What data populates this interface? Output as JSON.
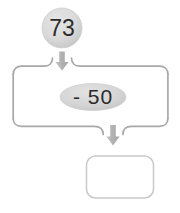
{
  "diagram": {
    "type": "function-machine-flow",
    "title": "",
    "start_node": {
      "label": "73",
      "shape": "circle",
      "fill_color": "#d9d9d9",
      "text_color": "#2b2b2b"
    },
    "operation_node": {
      "label": "- 50",
      "operator": "-",
      "operand": "50",
      "shape": "ellipse",
      "fill_color": "#d5d5d5",
      "text_color": "#2b2b2b"
    },
    "answer_node": {
      "label": "",
      "shape": "rounded-rectangle",
      "fill_color": "#ffffff",
      "border_color": "#c9c9c9"
    },
    "arrows": [
      {
        "name": "arrow-from-start",
        "direction": "down",
        "color": "#b5b5b5"
      },
      {
        "name": "arrow-to-answer",
        "direction": "down",
        "color": "#b5b5b5"
      }
    ],
    "bracket": {
      "name": "operation-bracket",
      "stroke_color": "#a8a8a8",
      "top_notch_x": 62,
      "bottom_notch_x": 113
    },
    "colors": {
      "background": "#ffffff",
      "node_grey": "#d9d9d9",
      "outline_grey": "#a8a8a8",
      "arrow_grey": "#b5b5b5",
      "text_dark": "#2b2b2b"
    }
  }
}
